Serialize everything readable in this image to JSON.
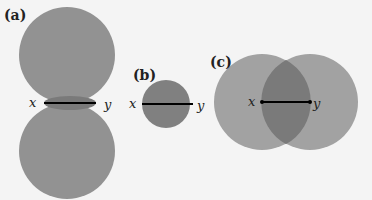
{
  "colors": {
    "background": "#f4f4f4",
    "disk": "#919191",
    "overlap": "#7a7a7a",
    "line": "#000000"
  },
  "panels": [
    {
      "label": "(a)",
      "point_x": "x",
      "point_y": "y",
      "description": "two disks touching, lune around segment"
    },
    {
      "label": "(b)",
      "point_x": "x",
      "point_y": "y",
      "description": "single disk with diameter xy"
    },
    {
      "label": "(c)",
      "point_x": "x",
      "point_y": "y",
      "description": "two overlapping disks centered at x and y"
    }
  ]
}
